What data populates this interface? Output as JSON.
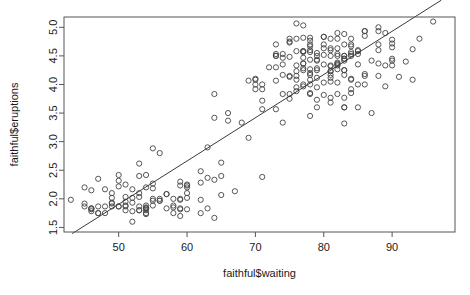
{
  "chart_data": {
    "type": "scatter",
    "title": "",
    "xlabel": "faithful$waiting",
    "ylabel": "faithful$eruptions",
    "xlim": [
      42.0,
      99.2
    ],
    "ylim": [
      1.42,
      5.18
    ],
    "xticks": [
      50,
      60,
      70,
      80,
      90
    ],
    "xtick_labels": [
      "50",
      "60",
      "70",
      "80",
      "90"
    ],
    "yticks": [
      1.5,
      2.0,
      2.5,
      3.0,
      3.5,
      4.0,
      4.5,
      5.0
    ],
    "ytick_labels": [
      "1.5",
      "2.0",
      "2.5",
      "3.0",
      "3.5",
      "4.0",
      "4.5",
      "5.0"
    ],
    "grid": false,
    "legend": "none",
    "marker": "open-circle",
    "marker_color": "#444444",
    "point_count": 272,
    "fit_line": {
      "type": "linear-regression",
      "slope": 0.0756,
      "intercept": -1.874,
      "color": "#3a3a3a",
      "x_start": 43.2,
      "x_end": 97.2
    },
    "x": [
      79,
      54,
      74,
      62,
      85,
      55,
      88,
      85,
      51,
      85,
      54,
      84,
      78,
      47,
      83,
      52,
      62,
      84,
      52,
      79,
      51,
      47,
      78,
      69,
      74,
      83,
      55,
      76,
      78,
      79,
      73,
      77,
      66,
      80,
      74,
      52,
      48,
      80,
      59,
      90,
      80,
      58,
      84,
      58,
      73,
      83,
      64,
      53,
      82,
      59,
      75,
      90,
      54,
      80,
      54,
      83,
      71,
      64,
      77,
      81,
      59,
      84,
      48,
      82,
      60,
      92,
      78,
      78,
      65,
      73,
      82,
      56,
      79,
      71,
      62,
      76,
      60,
      78,
      76,
      83,
      75,
      82,
      70,
      65,
      73,
      88,
      76,
      80,
      48,
      86,
      60,
      90,
      50,
      78,
      63,
      72,
      84,
      75,
      51,
      82,
      62,
      88,
      49,
      83,
      81,
      47,
      84,
      52,
      86,
      81,
      75,
      59,
      89,
      79,
      59,
      81,
      50,
      85,
      59,
      87,
      53,
      69,
      77,
      56,
      88,
      81,
      45,
      82,
      55,
      90,
      45,
      83,
      56,
      89,
      46,
      82,
      51,
      86,
      53,
      79,
      81,
      60,
      82,
      77,
      76,
      59,
      80,
      49,
      96,
      53,
      77,
      77,
      65,
      81,
      71,
      70,
      81,
      93,
      53,
      89,
      45,
      86,
      58,
      78,
      66,
      76,
      63,
      88,
      52,
      93,
      49,
      57,
      77,
      68,
      81,
      81,
      73,
      50,
      85,
      74,
      55,
      77,
      83,
      83,
      51,
      78,
      84,
      46,
      83,
      55,
      81,
      57,
      76,
      84,
      77,
      81,
      87,
      77,
      51,
      78,
      60,
      82,
      91,
      53,
      78,
      46,
      77,
      84,
      49,
      83,
      71,
      80,
      49,
      75,
      64,
      76,
      53,
      94,
      55,
      76,
      50,
      82,
      54,
      75,
      78,
      79,
      78,
      78,
      70,
      79,
      70,
      54,
      86,
      50,
      90,
      54,
      54,
      77,
      79,
      64,
      75,
      47,
      86,
      63,
      85,
      82,
      57,
      82,
      67,
      74,
      54,
      83,
      73,
      73,
      88,
      80,
      71,
      83,
      56,
      79,
      78,
      84,
      58,
      83,
      43,
      60,
      75,
      81,
      46,
      90,
      46,
      74
    ],
    "y": [
      3.6,
      1.8,
      3.333,
      2.283,
      4.533,
      2.883,
      4.7,
      3.6,
      1.95,
      4.35,
      1.833,
      3.917,
      4.2,
      1.75,
      4.7,
      2.167,
      1.75,
      4.8,
      1.6,
      4.25,
      1.8,
      1.75,
      3.45,
      3.067,
      4.533,
      3.6,
      1.967,
      4.083,
      3.85,
      4.433,
      4.3,
      4.467,
      3.367,
      4.033,
      3.833,
      2.017,
      1.867,
      4.833,
      1.833,
      4.783,
      4.35,
      1.883,
      4.567,
      1.75,
      4.533,
      3.317,
      3.833,
      2.1,
      4.633,
      2,
      4.8,
      4.716,
      1.833,
      4.833,
      1.733,
      4.883,
      3.717,
      1.667,
      4.567,
      4.317,
      2.233,
      4.5,
      1.75,
      4.8,
      1.817,
      4.4,
      4.167,
      4.7,
      2.067,
      4.7,
      4.033,
      1.967,
      4.5,
      4,
      1.983,
      5.067,
      2.017,
      4.567,
      3.883,
      3.6,
      4.133,
      4.333,
      4.1,
      2.633,
      4.067,
      4.933,
      3.95,
      4.517,
      2.167,
      4,
      2.2,
      4.333,
      1.867,
      4.817,
      1.833,
      4.3,
      4.667,
      3.75,
      1.867,
      4.9,
      2.483,
      4.367,
      2.1,
      4.5,
      4.05,
      1.867,
      4.7,
      1.783,
      4.85,
      3.683,
      4.733,
      2.3,
      4.9,
      4.417,
      1.7,
      4.633,
      2.317,
      4.6,
      1.817,
      4.417,
      2.617,
      4.067,
      4.25,
      1.967,
      4.6,
      3.767,
      1.917,
      4.5,
      2.267,
      4.65,
      1.867,
      4.167,
      2.8,
      4.333,
      1.833,
      4.383,
      1.883,
      4.933,
      2.033,
      3.733,
      4.233,
      2.233,
      4.533,
      4.817,
      4.333,
      1.983,
      4.633,
      2.017,
      5.1,
      1.8,
      5.033,
      4,
      2.4,
      4.6,
      3.567,
      4,
      4.5,
      4.083,
      1.8,
      3.967,
      2.2,
      4.15,
      2,
      3.833,
      3.5,
      4.583,
      2.367,
      5,
      1.933,
      4.617,
      1.917,
      2.083,
      4.583,
      3.333,
      4.167,
      4.333,
      4.5,
      2.417,
      4,
      4.167,
      1.883,
      4.583,
      4.25,
      3.767,
      2.033,
      4.433,
      4.083,
      1.833,
      4.417,
      2.183,
      4.8,
      1.833,
      4.8,
      4.1,
      3.966,
      4.233,
      3.5,
      4.366,
      2.25,
      4.667,
      2.1,
      4.35,
      4.133,
      1.867,
      4.6,
      1.783,
      4.367,
      3.85,
      1.933,
      4.5,
      2.383,
      4.7,
      1.867,
      3.833,
      3.417,
      4.233,
      2.4,
      4.8,
      2,
      4.15,
      1.867,
      4.267,
      1.75,
      4.483,
      4,
      4.117,
      4.083,
      4.267,
      3.917,
      4.55,
      4.083,
      2.417,
      4.183,
      2.217,
      4.45,
      1.883,
      1.85,
      4.283,
      3.95,
      2.333,
      4.15,
      2.35,
      4.933,
      2.9,
      4.583,
      3.833,
      2.083,
      4.367,
      2.133,
      4.35,
      2.2,
      4.45,
      3.567,
      4.5,
      4.15,
      3.817,
      3.917,
      4.45,
      2,
      4.283,
      4.767,
      4.533,
      1.85,
      4.25,
      1.983,
      2.25,
      4.75,
      4.117,
      2.15,
      4.417,
      1.817,
      4.467
    ]
  }
}
